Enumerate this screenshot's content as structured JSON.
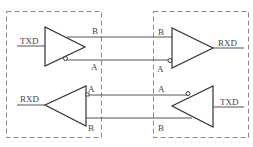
{
  "diagram": {
    "title": "",
    "boxes": [
      {
        "id": "left-node",
        "style": "dashed"
      },
      {
        "id": "right-node",
        "style": "dashed"
      }
    ],
    "top_channel": {
      "driver_input_label": "TXD",
      "driver_output_b_label": "B",
      "driver_output_a_label": "A",
      "receiver_input_b_label": "B",
      "receiver_input_a_label": "A",
      "receiver_output_label": "RXD"
    },
    "bottom_channel": {
      "receiver_output_label": "RXD",
      "receiver_input_a_label": "A",
      "receiver_input_b_label": "B",
      "driver_output_a_label": "A",
      "driver_output_b_label": "B",
      "driver_input_label": "TXD"
    },
    "colors": {
      "line": "#555555",
      "box_border": "#777777"
    }
  }
}
